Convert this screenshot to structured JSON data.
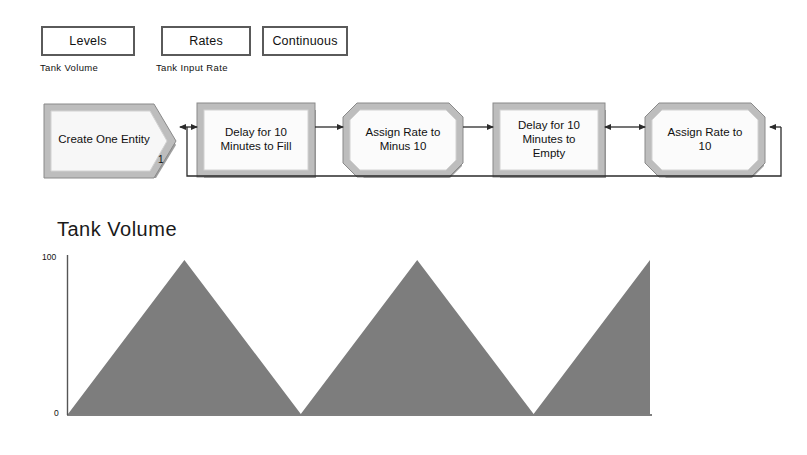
{
  "controls": [
    {
      "id": "levels",
      "label": "Levels",
      "caption": "Tank Volume"
    },
    {
      "id": "rates",
      "label": "Rates",
      "caption": "Tank Input Rate"
    },
    {
      "id": "continuous",
      "label": "Continuous",
      "caption": ""
    }
  ],
  "flowchart": {
    "blocks": [
      {
        "id": "create",
        "label": "Create One Entity",
        "shape": "pentagon"
      },
      {
        "id": "fill",
        "label": "Delay for 10\nMinutes to Fill",
        "shape": "rectangle"
      },
      {
        "id": "minus",
        "label": "Assign Rate to\nMinus 10",
        "shape": "octagon"
      },
      {
        "id": "empty",
        "label": "Delay for 10\nMinutes to\nEmpty",
        "shape": "rectangle"
      },
      {
        "id": "ten",
        "label": "Assign Rate to\n10",
        "shape": "octagon"
      }
    ],
    "entity_count": "1",
    "colors": {
      "block_border": "#9a9a9a",
      "block_fill": "#f2f2f2",
      "block_shadow": "#8c8c8c",
      "connector": "#2b2b2b"
    }
  },
  "chart_data": {
    "type": "area",
    "title": "Tank Volume",
    "xlabel": "",
    "ylabel": "",
    "ylim": [
      0,
      100
    ],
    "ytick_labels": [
      "100",
      "0"
    ],
    "grid": false,
    "legend": null,
    "series_name": "Tank Volume",
    "fill_color": "#7d7d7d",
    "axis_color": "#555555",
    "x": [
      0,
      120,
      240,
      360,
      480,
      600
    ],
    "y": [
      0,
      100,
      0,
      100,
      0,
      100
    ],
    "annotation": "Triangular wave: fills to 100 over 10 minutes, empties to 0 over 10 minutes, repeating; third rise truncated at plot edge."
  }
}
